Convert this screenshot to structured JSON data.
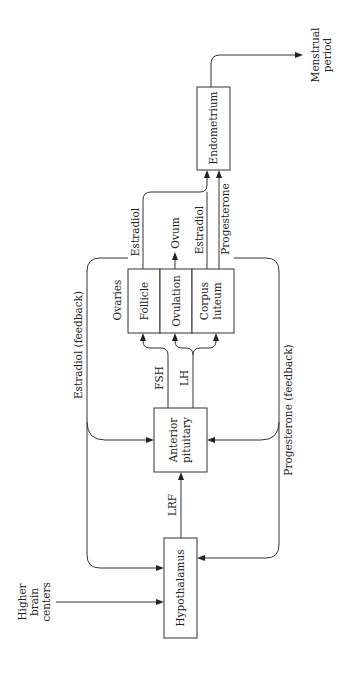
{
  "diagram": {
    "orientation": "rotated-90-ccw",
    "nodes": {
      "higher_brain": [
        "Higher",
        "brain",
        "centers"
      ],
      "hypothalamus": "Hypothalamus",
      "pituitary": [
        "Anterior",
        "pituitary"
      ],
      "ovaries": "Ovaries",
      "follicle": "Follicle",
      "ovulation": "Ovulation",
      "corpus_luteum": [
        "Corpus",
        "luteum"
      ],
      "endometrium": "Endometrium",
      "menstrual": [
        "Menstrual",
        "period"
      ]
    },
    "edges": {
      "lrf": "LRF",
      "fsh": "FSH",
      "lh": "LH",
      "ovum": "Ovum",
      "estradiol_follicle": "Estradiol",
      "estradiol_corpus": "Estradiol",
      "progesterone": "Progesterone",
      "estradiol_feedback": "Estradiol  (feedback)",
      "progesterone_feedback": "Progesterone  (feedback)"
    },
    "colors": {
      "line": "#333333",
      "text": "#222222",
      "background": "#ffffff"
    }
  }
}
